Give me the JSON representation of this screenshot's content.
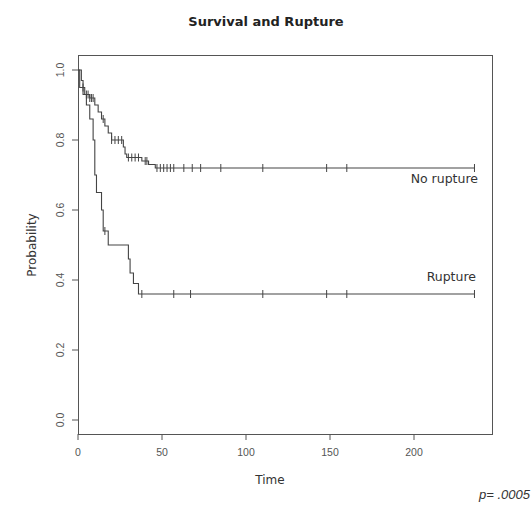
{
  "chart_data": {
    "type": "line",
    "subtype": "kaplan-meier step",
    "title": "Survival and Rupture",
    "xlabel": "Time",
    "ylabel": "Probability",
    "xlim": [
      0,
      240
    ],
    "ylim": [
      0,
      1.0
    ],
    "x_ticks": [
      0,
      50,
      100,
      150,
      200
    ],
    "y_ticks": [
      0.0,
      0.2,
      0.4,
      0.6,
      0.8,
      1.0
    ],
    "x_tick_labels": [
      "0",
      "50",
      "100",
      "150",
      "200"
    ],
    "y_tick_labels": [
      "0.0",
      "0.2",
      "0.4",
      "0.6",
      "0.8",
      "1.0"
    ],
    "grid": false,
    "annotation": "p= .0005",
    "series": [
      {
        "name": "No rupture",
        "steps": [
          [
            0,
            1.0
          ],
          [
            2,
            0.97
          ],
          [
            3,
            0.95
          ],
          [
            4,
            0.93
          ],
          [
            7,
            0.92
          ],
          [
            10,
            0.9
          ],
          [
            12,
            0.88
          ],
          [
            14,
            0.86
          ],
          [
            16,
            0.84
          ],
          [
            18,
            0.82
          ],
          [
            20,
            0.8
          ],
          [
            27,
            0.78
          ],
          [
            28,
            0.76
          ],
          [
            29,
            0.75
          ],
          [
            38,
            0.74
          ],
          [
            42,
            0.73
          ],
          [
            46,
            0.72
          ],
          [
            236,
            0.72
          ]
        ],
        "censored": [
          3,
          5,
          6,
          7,
          8,
          9,
          15,
          20,
          22,
          24,
          26,
          30,
          32,
          34,
          36,
          40,
          41,
          47,
          49,
          51,
          53,
          55,
          57,
          63,
          68,
          73,
          85,
          110,
          148,
          160,
          236
        ],
        "label_position": [
          232,
          0.775
        ]
      },
      {
        "name": "Rupture",
        "steps": [
          [
            0,
            1.0
          ],
          [
            1,
            0.95
          ],
          [
            3,
            0.93
          ],
          [
            5,
            0.9
          ],
          [
            7,
            0.86
          ],
          [
            9,
            0.8
          ],
          [
            10,
            0.7
          ],
          [
            11,
            0.65
          ],
          [
            14,
            0.6
          ],
          [
            15,
            0.54
          ],
          [
            18,
            0.5
          ],
          [
            30,
            0.46
          ],
          [
            31,
            0.42
          ],
          [
            33,
            0.39
          ],
          [
            36,
            0.36
          ],
          [
            236,
            0.36
          ]
        ],
        "censored": [
          16,
          38,
          57,
          67,
          110,
          148,
          160,
          236
        ],
        "label_position": [
          232,
          0.405
        ]
      }
    ]
  },
  "labels": {
    "title": "Survival and Rupture",
    "xlabel": "Time",
    "ylabel": "Probability",
    "no_rupture": "No rupture",
    "rupture": "Rupture",
    "pvalue": "p= .0005"
  }
}
